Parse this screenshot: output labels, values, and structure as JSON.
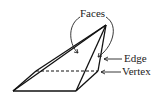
{
  "diagram": {
    "labels": {
      "faces": "Faces",
      "edge": "Edge",
      "vertex": "Vertex"
    },
    "colors": {
      "stroke": "#111111",
      "text": "#222222",
      "background": "#ffffff"
    }
  }
}
